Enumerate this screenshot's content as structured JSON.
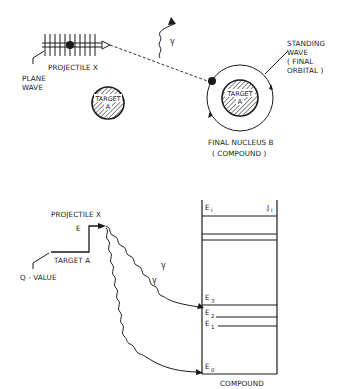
{
  "top_diagram": {
    "projectile_label": "PROJECTILE X",
    "plane_wave_label_line1": "PLANE",
    "plane_wave_label_line2": "WAVE",
    "gamma_label": "γ",
    "target_left_line1": "TARGET",
    "target_left_line2": "A",
    "target_right_line1": "TARGET",
    "target_right_line2": "A",
    "standing_wave_line1": "STANDING",
    "standing_wave_line2": "WAVE",
    "standing_wave_line3": "( FINAL",
    "standing_wave_line4": "ORBITAL )",
    "final_nucleus_line1": "FINAL  NUCLEUS B",
    "final_nucleus_line2": "( COMPOUND )"
  },
  "bottom_diagram": {
    "projectile_label": "PROJECTILE X",
    "energy_label": "E",
    "target_label": "TARGET A",
    "q_value_label": "Q - VALUE",
    "gamma1_label": "γ",
    "gamma2_label": "γ",
    "levels": [
      {
        "name": "E",
        "sub": "i",
        "spin": "J",
        "spin_sub": "i"
      },
      {
        "name": "E",
        "sub": "3"
      },
      {
        "name": "E",
        "sub": "2"
      },
      {
        "name": "E",
        "sub": "1"
      },
      {
        "name": "E",
        "sub": "0"
      }
    ],
    "compound_line1": "COMPOUND",
    "compound_line2": "NUCLEUS  B"
  },
  "colors": {
    "ink": "#1a1a1a",
    "background": "#ffffff"
  }
}
